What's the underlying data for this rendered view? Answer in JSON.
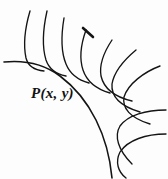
{
  "figure": {
    "background_color": "#fdfdfd",
    "stroke_color": "#141414",
    "width": 168,
    "height": 179,
    "labels": [
      {
        "name": "point-label-p",
        "text": "P(x, y)",
        "x": 31,
        "y": 86
      }
    ],
    "chart_data": {
      "type": "line",
      "title": "Curve with family of normal lines",
      "xlabel": "",
      "ylabel": "",
      "grid": false,
      "legend": null,
      "annotations": [
        {
          "text": "P(x, y)",
          "x": 31,
          "y": 86
        }
      ],
      "series": [
        {
          "name": "evolute-main-curve",
          "role": "envelope",
          "path": "M 4 62 C 24 60 44 64 60 76 C 76 88 88 104 96 120 C 104 136 110 156 112 178"
        },
        {
          "name": "normal-line-1",
          "role": "normal",
          "path": "M 30 11 C 25 28 23 44 26 58 C 28 66 34 70 44 71"
        },
        {
          "name": "normal-line-2",
          "role": "normal",
          "path": "M 47 11 C 43 29 42 47 46 60 C 49 69 56 74 66 76"
        },
        {
          "name": "normal-line-3",
          "role": "normal",
          "path": "M 64 18 C 61 36 61 52 66 64 C 70 74 78 80 89 83"
        },
        {
          "name": "normal-line-4",
          "role": "normal",
          "path": "M 86 30 C 81 44 79 58 83 70 C 87 82 96 89 110 93"
        },
        {
          "name": "normal-line-5",
          "role": "normal",
          "path": "M 112 40 C 104 52 99 64 101 76 C 104 89 115 97 132 101"
        },
        {
          "name": "normal-line-6",
          "role": "normal",
          "path": "M 136 50 C 124 60 114 72 112 84 C 111 96 120 106 140 112"
        },
        {
          "name": "normal-line-7",
          "role": "normal",
          "path": "M 160 66 C 144 72 128 84 124 97 C 122 108 130 118 150 124"
        },
        {
          "name": "normal-line-8",
          "role": "normal",
          "path": "M 166 110 C 146 110 128 115 120 126 C 114 136 118 150 132 164"
        },
        {
          "name": "normal-line-9",
          "role": "normal",
          "path": "M 166 134 C 146 134 128 140 120 152 C 115 162 118 172 126 178"
        },
        {
          "name": "accent-stroke-tip",
          "role": "accent",
          "path": "M 83 28 L 93 37"
        }
      ],
      "xlim": [
        0,
        168
      ],
      "ylim": [
        0,
        179
      ]
    }
  }
}
